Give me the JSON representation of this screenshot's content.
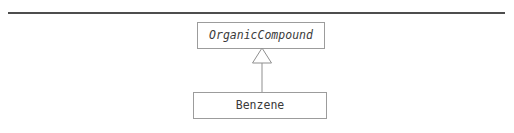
{
  "diagram": {
    "type": "uml-class-diagram",
    "notation": "UML",
    "background_color": "#ffffff",
    "rule_color": "#4d4d4d",
    "box_border_color": "#9c9c9c",
    "text_color": "#3a3a3a",
    "classes": [
      {
        "id": "organiccompound",
        "name": "OrganicCompound",
        "abstract": true,
        "font_style": "italic"
      },
      {
        "id": "benzene",
        "name": "Benzene",
        "abstract": false,
        "font_style": "normal"
      }
    ],
    "relationships": [
      {
        "type": "generalization",
        "label": "",
        "arrowhead": "hollow-triangle",
        "from": "Benzene",
        "to": "OrganicCompound"
      }
    ]
  }
}
